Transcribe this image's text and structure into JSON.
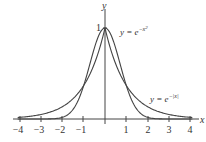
{
  "chart_data": {
    "type": "line",
    "title": "",
    "xlabel": "x",
    "ylabel": "y",
    "xlim": [
      -4,
      4
    ],
    "ylim": [
      0,
      1
    ],
    "x_ticks": [
      "−4",
      "−3",
      "−2",
      "−1",
      "1",
      "2",
      "3",
      "4"
    ],
    "y_ticks": [
      "1"
    ],
    "grid": false,
    "series": [
      {
        "name": "y = e^{-x^2}",
        "function": "exp(-x^2)",
        "x": [
          -4,
          -3,
          -2,
          -1.5,
          -1,
          -0.5,
          0,
          0.5,
          1,
          1.5,
          2,
          3,
          4
        ],
        "values": [
          0.0,
          0.0001,
          0.018,
          0.105,
          0.368,
          0.779,
          1,
          0.779,
          0.368,
          0.105,
          0.018,
          0.0001,
          0.0
        ]
      },
      {
        "name": "y = e^{-|x|}",
        "function": "exp(-abs(x))",
        "x": [
          -4,
          -3,
          -2,
          -1,
          -0.5,
          0,
          0.5,
          1,
          2,
          3,
          4
        ],
        "values": [
          0.018,
          0.05,
          0.135,
          0.368,
          0.607,
          1,
          0.607,
          0.368,
          0.135,
          0.05,
          0.018
        ]
      }
    ],
    "annotations": [
      {
        "text": "y = e^{-x^2}",
        "near_x": 0.6,
        "near_y": 0.9
      },
      {
        "text": "y = e^{-|x|}",
        "near_x": 3.2,
        "near_y": 0.28
      }
    ]
  },
  "labels": {
    "x_axis": "x",
    "y_axis": "y",
    "y_one": "1",
    "ticks": [
      "−4",
      "−3",
      "−2",
      "−1",
      "1",
      "2",
      "3",
      "4"
    ],
    "gauss_y": "y = e",
    "gauss_exp": "−x",
    "gauss_sq": "2",
    "lap_y": "y = e",
    "lap_exp": "−|x|"
  }
}
